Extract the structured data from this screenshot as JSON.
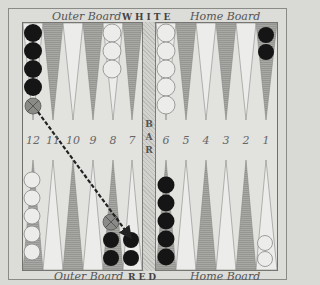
{
  "header": {
    "top_left": "Outer Board",
    "top_center": "WHITE",
    "top_right": "Home Board",
    "bottom_left": "Outer Board",
    "bottom_center": "RED",
    "bottom_right": "Home Board"
  },
  "bar": {
    "label": "BAR",
    "letters": [
      "B",
      "A",
      "R"
    ]
  },
  "point_numbers": {
    "left": [
      "12",
      "11",
      "10",
      "9",
      "8",
      "7"
    ],
    "right": [
      "6",
      "5",
      "4",
      "3",
      "2",
      "1"
    ]
  },
  "colors": {
    "dark_point": "#a3a3a0",
    "light_point": "#ececea",
    "black_checker": "#151515",
    "white_checker": "#ececea",
    "ghost_checker": "#7a7a76"
  },
  "checkers": {
    "top": [
      {
        "point_above": "12",
        "color": "black",
        "count": 4,
        "ghost": 1
      },
      {
        "point_above": "8",
        "color": "white",
        "count": 3
      },
      {
        "point_above": "6",
        "color": "white",
        "count": 5
      },
      {
        "point_above": "1",
        "color": "black",
        "count": 2
      }
    ],
    "bottom": [
      {
        "point": "12",
        "color": "white",
        "count": 5
      },
      {
        "point": "8",
        "color": "black",
        "count": 2,
        "ghost": 1
      },
      {
        "point": "7",
        "color": "black",
        "count": 2
      },
      {
        "point": "6",
        "color": "black",
        "count": 5
      },
      {
        "point": "1",
        "color": "white",
        "count": 2
      }
    ]
  },
  "move_arrow": {
    "from": "ghost checker above point 12",
    "to": "point 7",
    "style": "dashed"
  }
}
